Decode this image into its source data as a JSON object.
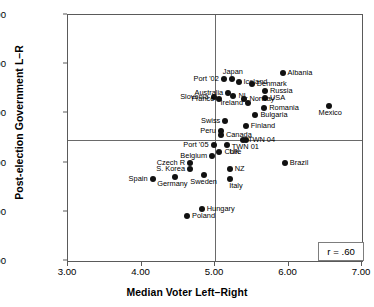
{
  "chart_data": {
    "type": "scatter",
    "title": "",
    "xlabel": "Median Voter Left–Right",
    "ylabel": "Post-election Government L–R",
    "xlim": [
      3.0,
      7.0
    ],
    "ylim": [
      0.0,
      10.0
    ],
    "xticks": [
      "3.00",
      "4.00",
      "5.00",
      "6.00",
      "7.00"
    ],
    "xtick_values": [
      3.0,
      4.0,
      5.0,
      6.0,
      7.0
    ],
    "yticks": [
      "0.00",
      "2.00",
      "4.00",
      "6.00",
      "8.00",
      "10.00"
    ],
    "ytick_values": [
      0.0,
      2.0,
      4.0,
      6.0,
      8.0,
      10.0
    ],
    "grid": false,
    "legend": "none",
    "reference_lines": [
      {
        "orientation": "horizontal",
        "value": 4.9
      },
      {
        "orientation": "vertical",
        "value": 5.0
      }
    ],
    "annotations": [
      {
        "name": "correlation-box",
        "text": "r = .60",
        "x": 6.42,
        "y": 0.75
      }
    ],
    "points": [
      {
        "label": "Albania",
        "x": 5.92,
        "y": 7.63,
        "label_pos": "right"
      },
      {
        "label": "Japan",
        "x": 5.23,
        "y": 7.4,
        "label_pos": "top"
      },
      {
        "label": "Iceland",
        "x": 5.32,
        "y": 7.26,
        "label_pos": "right"
      },
      {
        "label": "Port '02",
        "x": 5.12,
        "y": 7.4,
        "label_pos": "left"
      },
      {
        "label": "Denmark",
        "x": 5.5,
        "y": 7.18,
        "label_pos": "right"
      },
      {
        "label": "Russia",
        "x": 5.68,
        "y": 6.93,
        "label_pos": "right"
      },
      {
        "label": "Australia",
        "x": 5.18,
        "y": 6.82,
        "label_pos": "left"
      },
      {
        "label": "USA",
        "x": 5.68,
        "y": 6.62,
        "label_pos": "right"
      },
      {
        "label": "Slovenia",
        "x": 4.98,
        "y": 6.65,
        "label_pos": "left"
      },
      {
        "label": "NL",
        "x": 5.25,
        "y": 6.7,
        "label_pos": "right"
      },
      {
        "label": "Norway",
        "x": 5.4,
        "y": 6.6,
        "label_pos": "right"
      },
      {
        "label": "France",
        "x": 5.06,
        "y": 6.6,
        "label_pos": "left"
      },
      {
        "label": "Romania",
        "x": 5.67,
        "y": 6.22,
        "label_pos": "right"
      },
      {
        "label": "Ireland",
        "x": 5.45,
        "y": 6.43,
        "label_pos": "left"
      },
      {
        "label": "Mexico",
        "x": 6.55,
        "y": 6.3,
        "label_pos": "bottom"
      },
      {
        "label": "Bulgaria",
        "x": 5.55,
        "y": 5.95,
        "label_pos": "right"
      },
      {
        "label": "Swiss",
        "x": 5.14,
        "y": 5.7,
        "label_pos": "left"
      },
      {
        "label": "Finland",
        "x": 5.42,
        "y": 5.5,
        "label_pos": "right"
      },
      {
        "label": "Peru",
        "x": 5.08,
        "y": 5.3,
        "label_pos": "left"
      },
      {
        "label": "Canada",
        "x": 5.08,
        "y": 5.12,
        "label_pos": "right"
      },
      {
        "label": "TWN 04",
        "x": 5.38,
        "y": 4.92,
        "label_pos": "right"
      },
      {
        "label": "Port '05",
        "x": 4.98,
        "y": 4.7,
        "label_pos": "left"
      },
      {
        "label": "UK",
        "x": 5.16,
        "y": 4.72,
        "label_pos": "bottom"
      },
      {
        "label": "TWN 01",
        "x": 5.42,
        "y": 4.9,
        "label_pos": "bottom"
      },
      {
        "label": "Belgium",
        "x": 4.96,
        "y": 4.28,
        "label_pos": "left"
      },
      {
        "label": "Chile",
        "x": 5.06,
        "y": 4.42,
        "label_pos": "right"
      },
      {
        "label": "Czech R",
        "x": 4.66,
        "y": 4.0,
        "label_pos": "left"
      },
      {
        "label": "Brazil",
        "x": 5.95,
        "y": 4.0,
        "label_pos": "right"
      },
      {
        "label": "S. Korea",
        "x": 4.66,
        "y": 3.72,
        "label_pos": "left"
      },
      {
        "label": "NZ",
        "x": 5.2,
        "y": 3.72,
        "label_pos": "right"
      },
      {
        "label": "Spain",
        "x": 4.15,
        "y": 3.32,
        "label_pos": "left"
      },
      {
        "label": "Germany",
        "x": 4.45,
        "y": 3.4,
        "label_pos": "bottom"
      },
      {
        "label": "Sweden",
        "x": 4.85,
        "y": 3.5,
        "label_pos": "bottom"
      },
      {
        "label": "Italy",
        "x": 5.2,
        "y": 3.35,
        "label_pos": "bottom"
      },
      {
        "label": "Hungary",
        "x": 4.82,
        "y": 2.13,
        "label_pos": "right"
      },
      {
        "label": "Poland",
        "x": 4.62,
        "y": 1.83,
        "label_pos": "right"
      }
    ]
  }
}
